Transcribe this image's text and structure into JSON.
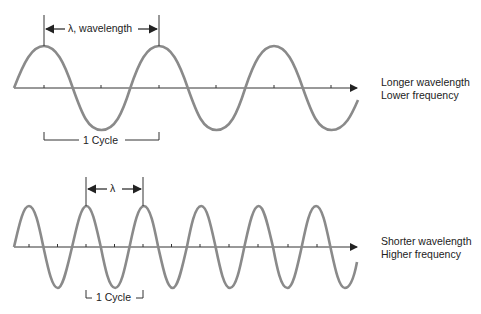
{
  "top_panel": {
    "wavelength_label": "λ, wavelength",
    "cycle_label": "1 Cycle",
    "description_line1": "Longer wavelength",
    "description_line2": "Lower frequency"
  },
  "bottom_panel": {
    "wavelength_label": "λ",
    "cycle_label": "1 Cycle",
    "description_line1": "Shorter wavelength",
    "description_line2": "Higher frequency"
  },
  "colors": {
    "wave": "#8a8a8a",
    "axis": "#333333",
    "text": "#222222"
  }
}
